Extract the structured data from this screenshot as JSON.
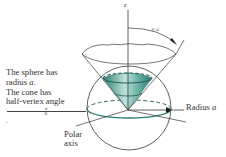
{
  "figure": {
    "type": "diagram",
    "axis_label_z": "z",
    "angle_label": {
      "numerator": "π",
      "denominator": "6"
    },
    "caption": {
      "line1": "The sphere has",
      "line2_prefix": "radius ",
      "line2_var": "a",
      "line2_suffix": ".",
      "line3": "The cone has",
      "line4": "half-vertex angle",
      "angle": {
        "numerator": "π",
        "denominator": "6",
        "suffix": "."
      }
    },
    "radius_label": {
      "text": "Radius ",
      "var": "a"
    },
    "polar_axis_label": {
      "line1": "Polar",
      "line2": "axis"
    },
    "colors": {
      "line": "#3a3a3a",
      "teal_dark": "#2e7d74",
      "teal_light": "#a9d6cf",
      "teal_mid": "#5fa99e",
      "background": "#ffffff"
    }
  }
}
